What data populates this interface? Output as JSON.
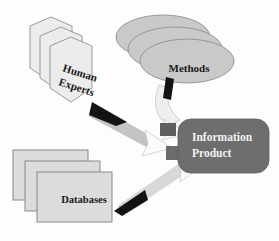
{
  "diagram": {
    "type": "information-flow-diagram",
    "background_color": "#fdfdfd",
    "nodes": [
      {
        "id": "human-experts",
        "label_line1": "Human",
        "label_line2": "Experts",
        "shape": "hexagon-stack",
        "stack_count": 3,
        "fill_color": "#ececec",
        "stroke_color": "#8a8a8a",
        "text_rotation_deg": 18,
        "text_color": "#1a1a1a"
      },
      {
        "id": "methods",
        "label_line1": "Methods",
        "shape": "ellipse-stack",
        "stack_count": 3,
        "fill_color": "#c9c9c9",
        "stroke_color": "#8a8a8a",
        "text_color": "#1a1a1a"
      },
      {
        "id": "databases",
        "label_line1": "Databases",
        "shape": "rectangle-stack",
        "stack_count": 3,
        "fill_color": "#dcdcdc",
        "stroke_color": "#7a7a7a",
        "text_color": "#1a1a1a"
      },
      {
        "id": "information-product",
        "label_line1": "Information",
        "label_line2": "Product",
        "shape": "rounded-rectangle",
        "fill_color": "#6e6e6e",
        "stroke_color": "#5a5a5a",
        "text_color": "#f2f2f2"
      }
    ],
    "connectors": [
      {
        "id": "experts-to-product",
        "from": "human-experts",
        "to": "information-product",
        "style": "bidirectional-ribbon",
        "ribbon_color": "#c4c4c4",
        "head_forward_color": "#ffffff",
        "head_back_color": "#111111"
      },
      {
        "id": "methods-to-product",
        "from": "methods",
        "to": "information-product",
        "style": "bidirectional-ribbon",
        "ribbon_color": "#c4c4c4",
        "head_forward_color": "#ffffff",
        "head_back_color": "#111111"
      },
      {
        "id": "databases-to-product",
        "from": "databases",
        "to": "information-product",
        "style": "bidirectional-ribbon",
        "ribbon_color": "#c4c4c4",
        "head_forward_color": "#ffffff",
        "head_back_color": "#111111"
      }
    ]
  }
}
